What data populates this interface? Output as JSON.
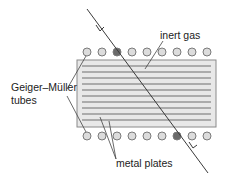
{
  "diagram": {
    "labels": {
      "inert_gas": "inert gas",
      "gm_tubes_line1": "Geiger–Müller",
      "gm_tubes_line2": "tubes",
      "metal_plates": "metal plates"
    },
    "colors": {
      "chamber_fill": "#e8e8e8",
      "chamber_stroke": "#8a8a8a",
      "plate_line": "#6e6e6e",
      "tube_fill": "#dcdcdc",
      "tube_stroke": "#7a7a7a",
      "tube_triggered_fill": "#6a6a6a",
      "track_line": "#3a3a3a"
    },
    "top_tubes": {
      "count": 9,
      "triggered_index": 2
    },
    "bottom_tubes": {
      "count": 9,
      "triggered_index": 6
    },
    "plate_count": 11
  }
}
